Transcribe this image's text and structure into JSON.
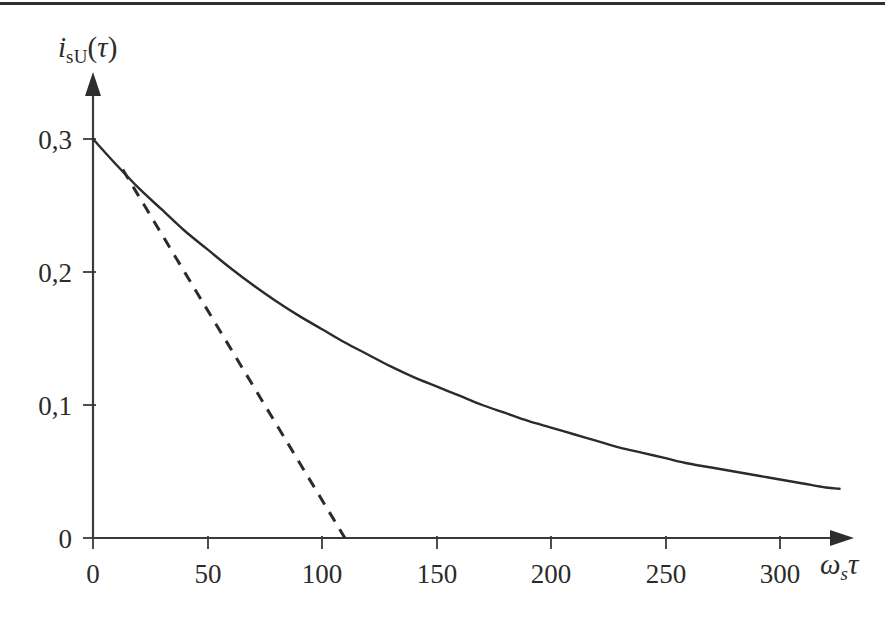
{
  "figure": {
    "background_color": "#ffffff",
    "ink_color": "#2b2b2b",
    "top_rule": true
  },
  "labels": {
    "y_axis_symbol": "i",
    "y_axis_subscript": "sU",
    "y_axis_open_paren": "(",
    "y_axis_tau": "τ",
    "y_axis_close_paren": ")",
    "x_axis_symbol": "ω",
    "x_axis_subscript": "s",
    "x_axis_tau": "τ"
  },
  "chart_data": {
    "type": "line",
    "title": "",
    "xlabel": "ωsτ",
    "ylabel": "isU(τ)",
    "xlim": [
      0,
      330
    ],
    "ylim": [
      0,
      0.33
    ],
    "grid": false,
    "legend": null,
    "decimal_separator": ",",
    "x_ticks": [
      {
        "value": 0,
        "label": "0"
      },
      {
        "value": 50,
        "label": "50"
      },
      {
        "value": 100,
        "label": "100"
      },
      {
        "value": 150,
        "label": "150"
      },
      {
        "value": 200,
        "label": "200"
      },
      {
        "value": 250,
        "label": "250"
      },
      {
        "value": 300,
        "label": "300"
      }
    ],
    "y_ticks": [
      {
        "value": 0,
        "label": "0"
      },
      {
        "value": 0.1,
        "label": "0,1"
      },
      {
        "value": 0.2,
        "label": "0,2"
      },
      {
        "value": 0.3,
        "label": "0,3"
      }
    ],
    "series": [
      {
        "name": "isU(τ)",
        "style": "solid",
        "x": [
          0,
          10,
          20,
          30,
          40,
          50,
          60,
          70,
          80,
          90,
          100,
          110,
          120,
          130,
          140,
          150,
          160,
          170,
          180,
          190,
          200,
          210,
          220,
          230,
          240,
          250,
          260,
          270,
          280,
          290,
          300,
          310,
          320,
          326
        ],
        "y": [
          0.3,
          0.281,
          0.263,
          0.247,
          0.231,
          0.217,
          0.203,
          0.19,
          0.178,
          0.167,
          0.157,
          0.147,
          0.138,
          0.129,
          0.121,
          0.114,
          0.107,
          0.1,
          0.094,
          0.088,
          0.083,
          0.078,
          0.073,
          0.068,
          0.064,
          0.06,
          0.056,
          0.053,
          0.05,
          0.047,
          0.044,
          0.041,
          0.038,
          0.037
        ]
      },
      {
        "name": "tangent-asymptote",
        "style": "dashed",
        "x": [
          13,
          110
        ],
        "y": [
          0.277,
          0.0
        ]
      }
    ],
    "annotations": [
      {
        "text": "initial value",
        "x": 0,
        "y": 0.3
      },
      {
        "text": "tangent intercept",
        "x": 110,
        "y": 0
      }
    ]
  }
}
